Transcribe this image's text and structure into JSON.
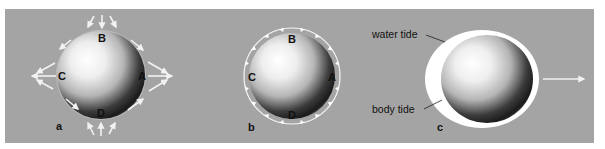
{
  "colors": {
    "background": "#ffffff",
    "band": "#a4a4a4",
    "arrow": "#f2f2f2",
    "label": "#111111",
    "water_tide": "#ffffff",
    "sphere_light": "#ffffff",
    "sphere_dark": "#161616"
  },
  "panels": [
    {
      "id": "a",
      "label": "a",
      "points": {
        "top": "B",
        "left": "C",
        "right": "A",
        "bottom": "D"
      },
      "description": "tidal forces: arrows pointing inward at B and D, outward at A and C"
    },
    {
      "id": "b",
      "label": "b",
      "points": {
        "top": "B",
        "left": "C",
        "right": "A",
        "bottom": "D"
      },
      "description": "tangential tide-raising forces along the surface toward A and C"
    },
    {
      "id": "c",
      "label": "c",
      "annotations": {
        "water_tide": "water tide",
        "body_tide": "body tide"
      },
      "description": "elongated water tide and body tide with direction arrow"
    }
  ],
  "icons": {
    "force_arrow": "arrow-icon",
    "direction_arrow": "right-arrow-icon"
  }
}
